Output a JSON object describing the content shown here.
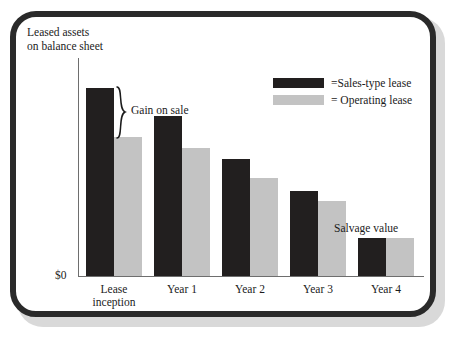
{
  "chart_data": {
    "type": "bar",
    "title": "",
    "xlabel": "",
    "ylabel": "Leased assets\non balance sheet",
    "categories": [
      "Lease\ninception",
      "Year 1",
      "Year 2",
      "Year 3",
      "Year 4"
    ],
    "series": [
      {
        "name": "=Sales-type lease",
        "key": "sales_type",
        "color": "#221f1f",
        "values": [
          100,
          85,
          62,
          45,
          20
        ]
      },
      {
        "name": "= Operating lease",
        "key": "operating",
        "color": "#c3c3c3",
        "values": [
          74,
          68,
          52,
          40,
          20
        ]
      }
    ],
    "ylim": [
      0,
      116
    ],
    "y_zero_label": "$0",
    "grid": false,
    "legend_position": "top-right",
    "annotations": [
      {
        "name": "gain-on-sale",
        "text": "Gain on sale",
        "marker": "brace",
        "category": "Lease\ninception",
        "from_series": "operating",
        "to_series": "sales_type"
      },
      {
        "name": "salvage-value",
        "text": "Salvage value",
        "marker": "none",
        "category": "Year 4"
      }
    ]
  },
  "axes": {
    "y_title": "Leased assets\non balance sheet",
    "zero_label": "$0"
  },
  "legend": {
    "items": [
      {
        "label": "=Sales-type lease",
        "swatch": "dark"
      },
      {
        "label": "= Operating lease",
        "swatch": "light"
      }
    ]
  },
  "annotations": {
    "gain_on_sale": "Gain on sale",
    "salvage_value": "Salvage value"
  },
  "colors": {
    "sales_type_lease": "#221f1f",
    "operating_lease": "#c3c3c3",
    "frame": "#2a2a2a",
    "axis": "#6e6e6e",
    "text": "#1b1b1b",
    "background": "#ffffff"
  }
}
